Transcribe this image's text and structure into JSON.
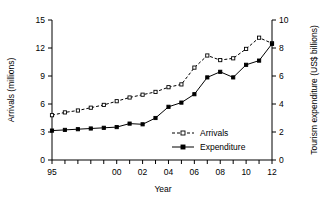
{
  "chart_data": {
    "type": "line",
    "title": "",
    "xlabel": "Year",
    "ylabel": "Arrivals (millions)",
    "y2label": "Tourism expenditure (US$ billions)",
    "x": [
      1995,
      1996,
      1997,
      1998,
      1999,
      2000,
      2001,
      2002,
      2003,
      2004,
      2005,
      2006,
      2007,
      2008,
      2009,
      2010,
      2011,
      2012
    ],
    "xtick_labels": [
      "95",
      "",
      "",
      "",
      "",
      "00",
      "",
      "02",
      "",
      "04",
      "",
      "06",
      "",
      "08",
      "",
      "10",
      "",
      "12"
    ],
    "xtick_labels_shown": [
      "95",
      "00",
      "02",
      "04",
      "06",
      "08",
      "10",
      "12"
    ],
    "xlim": [
      1995,
      2012
    ],
    "ylim": [
      0,
      15
    ],
    "yticks": [
      0,
      3,
      6,
      9,
      12,
      15
    ],
    "y2lim": [
      0,
      10
    ],
    "y2ticks": [
      0,
      2,
      4,
      6,
      8,
      10
    ],
    "grid": false,
    "legend_position": "inside-lower-center",
    "series": [
      {
        "name": "Arrivals",
        "axis": "left",
        "units": "millions",
        "line_style": "dashed",
        "marker": "open-square",
        "color": "#000000",
        "values": [
          4.8,
          5.1,
          5.3,
          5.6,
          5.9,
          6.3,
          6.7,
          7.0,
          7.3,
          7.8,
          8.1,
          9.9,
          11.2,
          10.7,
          10.9,
          11.9,
          13.1,
          12.5
        ]
      },
      {
        "name": "Expenditure",
        "axis": "right",
        "units": "US$ billions",
        "line_style": "solid",
        "marker": "filled-square",
        "color": "#000000",
        "values": [
          2.1,
          2.15,
          2.2,
          2.25,
          2.3,
          2.35,
          2.6,
          2.55,
          3.0,
          3.8,
          4.1,
          4.7,
          5.9,
          6.3,
          5.9,
          6.8,
          7.1,
          8.3
        ]
      }
    ]
  },
  "legend": {
    "entries": [
      {
        "label": "Arrivals",
        "marker": "open-square",
        "line_style": "dashed"
      },
      {
        "label": "Expenditure",
        "marker": "filled-square",
        "line_style": "solid"
      }
    ]
  }
}
